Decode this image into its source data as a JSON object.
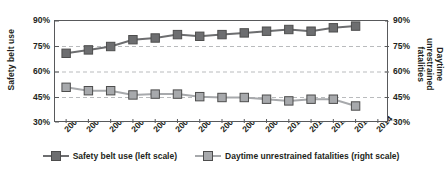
{
  "chart_data": {
    "type": "line",
    "title": "",
    "xlabel": "",
    "ylabel": "Safety belt use",
    "y2label": "Daytime unrestrained fatalities",
    "grid": true,
    "legend_position": "bottom",
    "x": [
      2000,
      2001,
      2002,
      2003,
      2004,
      2005,
      2006,
      2007,
      2008,
      2009,
      2010,
      2011,
      2012,
      2013,
      2014
    ],
    "categories": [
      "2000",
      "2001",
      "2002",
      "2003",
      "2004",
      "2005",
      "2006",
      "2007",
      "2008",
      "2009",
      "2010",
      "2011",
      "2012",
      "2013",
      "2014"
    ],
    "ylim": [
      30,
      90
    ],
    "y2lim": [
      30,
      90
    ],
    "yticks": [
      30,
      45,
      60,
      75,
      90
    ],
    "ytick_labels": [
      "30%",
      "45%",
      "60%",
      "75%",
      "90%"
    ],
    "y2tick_labels": [
      "30%",
      "45%",
      "60%",
      "75%",
      "90%"
    ],
    "series": [
      {
        "name": "Safety belt use (left scale)",
        "axis": "left",
        "color": "#6d6e70",
        "values": [
          71,
          73,
          75,
          79,
          80,
          82,
          81,
          82,
          83,
          84,
          85,
          84,
          86,
          87,
          null
        ]
      },
      {
        "name": "Daytime unrestrained fatalities (right scale)",
        "axis": "right",
        "color": "#a7a9ac",
        "values": [
          51,
          49,
          49,
          46.5,
          47,
          47,
          45.5,
          45,
          45,
          44,
          43,
          44,
          44,
          40,
          null
        ]
      }
    ]
  },
  "axes": {
    "left_title": "Safety belt use",
    "right_title_line1": "Daytime unrestrained",
    "right_title_line2": "fatalities"
  },
  "legend": {
    "items": [
      {
        "label": "Safety belt use (left scale)",
        "color": "#6d6e70"
      },
      {
        "label": "Daytime unrestrained fatalities (right scale)",
        "color": "#a7a9ac"
      }
    ]
  }
}
